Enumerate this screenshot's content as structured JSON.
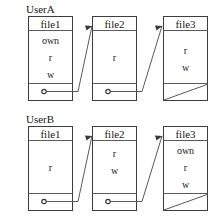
{
  "diagram": {
    "stroke_color": "#5a5a5a",
    "box_border_color": "#3d3d3d",
    "background_color": "#ffffff",
    "rows": [
      {
        "user_label": "UserA",
        "nodes": [
          {
            "file_label": "file1",
            "permissions": [
              "own",
              "r",
              "w"
            ],
            "has_pointer": true,
            "has_null_slash": false
          },
          {
            "file_label": "file2",
            "permissions": [
              "r"
            ],
            "has_pointer": true,
            "has_null_slash": false
          },
          {
            "file_label": "file3",
            "permissions": [
              "r",
              "w"
            ],
            "has_pointer": false,
            "has_null_slash": true
          }
        ]
      },
      {
        "user_label": "UserB",
        "nodes": [
          {
            "file_label": "file1",
            "permissions": [
              "r"
            ],
            "has_pointer": true,
            "has_null_slash": false
          },
          {
            "file_label": "file2",
            "permissions": [
              "r",
              "w"
            ],
            "has_pointer": true,
            "has_null_slash": false
          },
          {
            "file_label": "file3",
            "permissions": [
              "own",
              "r",
              "w"
            ],
            "has_pointer": false,
            "has_null_slash": true
          }
        ]
      }
    ]
  }
}
